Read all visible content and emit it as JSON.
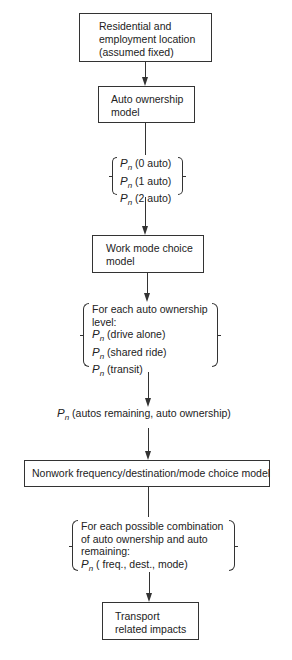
{
  "diagram": {
    "nodes": {
      "residential": {
        "lines": [
          "Residential and",
          "employment location",
          "(assumed fixed)"
        ]
      },
      "auto_ownership": {
        "lines": [
          "Auto ownership",
          "model"
        ]
      },
      "work_mode": {
        "lines": [
          "Work mode choice",
          "model"
        ]
      },
      "nonwork": {
        "lines": [
          "Nonwork frequency/destination/mode choice model"
        ]
      },
      "impacts": {
        "lines": [
          "Transport",
          "related impacts"
        ]
      }
    },
    "outputs": {
      "auto_probs": {
        "symbol": "P",
        "subscript": "n",
        "items": [
          "(0 auto)",
          "(1 auto)",
          "(2 auto)"
        ]
      },
      "work_probs": {
        "header": [
          "For each auto ownership",
          "level:"
        ],
        "symbol": "P",
        "subscript": "n",
        "items": [
          "(drive alone)",
          "(shared ride)",
          "(transit)"
        ]
      },
      "remaining": {
        "symbol": "P",
        "subscript": "n",
        "text": "(autos remaining, auto ownership)"
      },
      "nonwork_probs": {
        "header": [
          "For each possible combination",
          "of auto ownership and auto",
          "remaining:"
        ],
        "symbol": "P",
        "subscript": "n",
        "items": [
          "( freq., dest., mode)"
        ]
      }
    }
  }
}
